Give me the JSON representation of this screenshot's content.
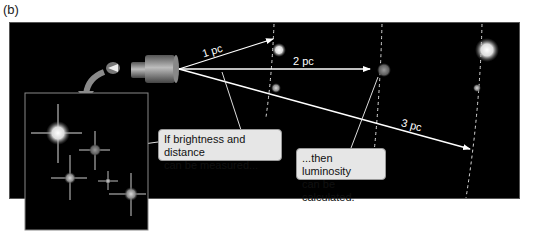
{
  "figure": {
    "panel_label": "(b)",
    "distance_labels": [
      "1 pc",
      "2 pc",
      "3 pc"
    ],
    "callouts": [
      {
        "lines": [
          "If brightness and distance",
          "can be measured..."
        ]
      },
      {
        "lines": [
          "...then luminosity",
          "can be calculated."
        ]
      }
    ],
    "colors": {
      "background": "#000000",
      "arrow": "#ffffff",
      "callout_bg": "#e6e6e6",
      "dashed_arc": "#dddddd"
    }
  }
}
